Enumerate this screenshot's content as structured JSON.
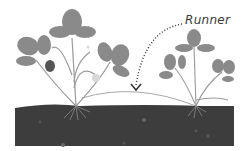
{
  "diagram": {
    "labels": {
      "runner": "Runner"
    },
    "colors": {
      "background": "#ffffff",
      "soil": "#3d3d3d",
      "leaf": "#8a8a8a",
      "stem": "#9a9a9a",
      "runner_line": "#a8a8a8",
      "berry": "#555555",
      "flower": "#d8d8d8",
      "arrow": "#333333",
      "text": "#3a3a3a"
    },
    "elements": [
      "parent-plant",
      "runner",
      "daughter-plant",
      "soil",
      "pointer-arrow"
    ]
  }
}
